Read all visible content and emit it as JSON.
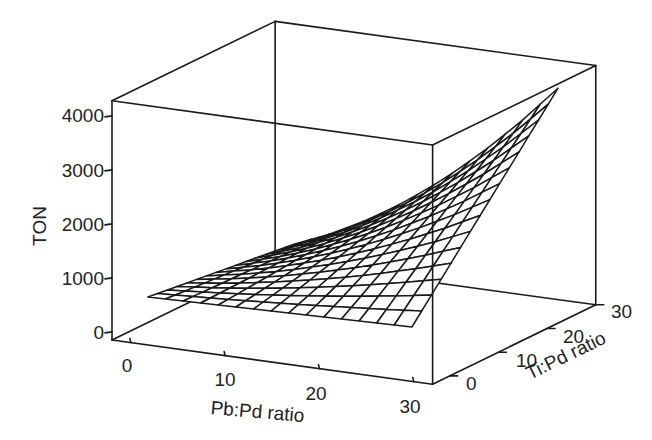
{
  "chart_data": {
    "type": "surface3d",
    "title": "",
    "xlabel": "Pb:Pd ratio",
    "ylabel": "Ti:Pd ratio",
    "zlabel": "TON",
    "x_ticks": [
      0,
      10,
      20,
      30
    ],
    "y_ticks": [
      0,
      10,
      20,
      30
    ],
    "z_ticks": [
      0,
      1000,
      2000,
      3000,
      4000
    ],
    "xlim": [
      -2,
      32
    ],
    "ylim": [
      -3.5,
      30
    ],
    "zlim": [
      -150,
      4280
    ],
    "x": [
      0,
      4,
      8,
      12,
      16,
      20,
      24,
      28
    ],
    "y": [
      0,
      5,
      10,
      15,
      20,
      25,
      30
    ],
    "z": [
      [
        540,
        557,
        574,
        592,
        609,
        626,
        643,
        660
      ],
      [
        484,
        547,
        622,
        709,
        808,
        920,
        1043,
        1178
      ],
      [
        427,
        536,
        669,
        827,
        1008,
        1213,
        1442,
        1695
      ],
      [
        371,
        526,
        717,
        944,
        1207,
        1507,
        1842,
        2213
      ],
      [
        314,
        515,
        764,
        1062,
        1407,
        1800,
        2241,
        2730
      ],
      [
        258,
        505,
        812,
        1179,
        1606,
        2094,
        2641,
        3248
      ],
      [
        201,
        494,
        859,
        1297,
        1806,
        2387,
        3040,
        3765
      ]
    ],
    "mesh_divisions": 15,
    "grid": false,
    "legend": null,
    "colors": {
      "line": "#1a1a1a",
      "face": "#ffffff",
      "text": "#222222"
    }
  },
  "labels": {
    "x_axis": "Pb:Pd ratio",
    "y_axis": "Ti:Pd ratio",
    "z_axis": "TON",
    "x_ticks": [
      "0",
      "10",
      "20",
      "30"
    ],
    "y_ticks": [
      "0",
      "10",
      "20",
      "30"
    ],
    "z_ticks": [
      "0",
      "1000",
      "2000",
      "3000",
      "4000"
    ]
  }
}
